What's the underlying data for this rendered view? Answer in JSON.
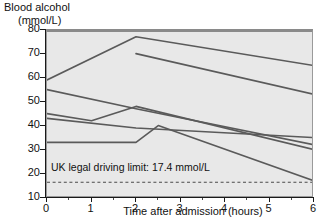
{
  "chart_data": {
    "type": "line",
    "title": "",
    "ylabel": "Blood alcohol (mmol/L)",
    "ylabel_line1": "Blood alcohol",
    "ylabel_line2": "(mmol/L)",
    "xlabel": "Time after admission (hours)",
    "xlim": [
      0,
      6
    ],
    "ylim": [
      10,
      80
    ],
    "yticks": [
      10,
      20,
      30,
      40,
      50,
      60,
      70,
      80
    ],
    "ytick_labels": [
      "10",
      "20",
      "30",
      "40",
      "50",
      "60",
      "70",
      "80"
    ],
    "xticks": [
      0,
      1,
      2,
      3,
      4,
      5,
      6
    ],
    "xtick_labels": [
      "0",
      "1",
      "2",
      "3",
      "4",
      "5",
      "6"
    ],
    "xticks_minor": [
      0.5,
      1.5,
      2.5,
      3.5,
      4.5,
      5.5
    ],
    "grid": false,
    "legend": "none",
    "plot_background": "#e8e8e8",
    "line_color": "#5a5a5a",
    "annotations": [
      {
        "name": "uk-legal-driving-limit",
        "text": "UK legal driving limit: 17.4 mmol/L",
        "value": 17.4,
        "style": "dashed-horizontal-line",
        "color": "#4a4a4a"
      }
    ],
    "series": [
      {
        "name": "patient-1",
        "x": [
          0,
          2,
          6
        ],
        "values": [
          60,
          78,
          66
        ]
      },
      {
        "name": "patient-2",
        "x": [
          0,
          2,
          6
        ],
        "values": [
          56,
          48,
          33
        ]
      },
      {
        "name": "patient-3",
        "x": [
          2,
          6
        ],
        "values": [
          71,
          54
        ]
      },
      {
        "name": "patient-4",
        "x": [
          0,
          1,
          2,
          6
        ],
        "values": [
          46,
          43,
          49,
          31
        ]
      },
      {
        "name": "patient-5",
        "x": [
          0,
          2,
          6
        ],
        "values": [
          44,
          40,
          36
        ]
      },
      {
        "name": "patient-6",
        "x": [
          0,
          2,
          2.5,
          6
        ],
        "values": [
          34,
          34,
          41,
          18
        ]
      }
    ]
  }
}
